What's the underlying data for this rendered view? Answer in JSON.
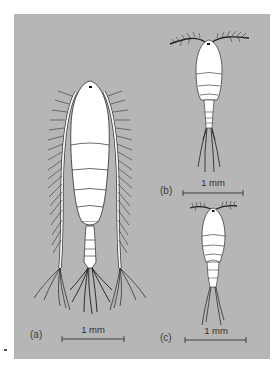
{
  "figure": {
    "background_color": "#b6b6b6",
    "body_color": "#ffffff",
    "outline_color": "#2a2a2a",
    "panels": [
      {
        "id": "a",
        "label": "(a)",
        "scale_label": "1 mm"
      },
      {
        "id": "b",
        "label": "(b)",
        "scale_label": "1 mm"
      },
      {
        "id": "c",
        "label": "(c)",
        "scale_label": "1 mm"
      }
    ]
  }
}
